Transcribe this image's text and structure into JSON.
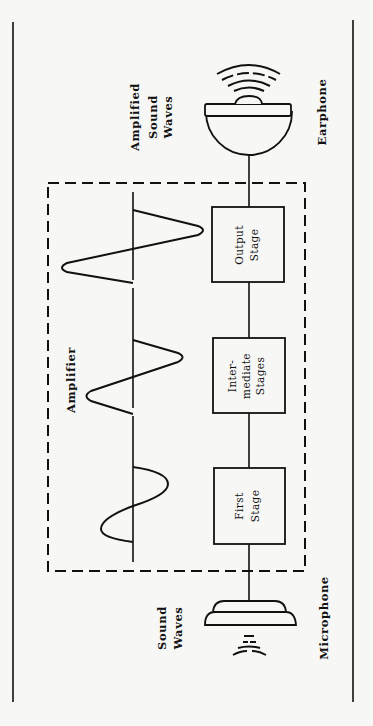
{
  "diagram": {
    "labels": {
      "amplified_sound_waves": [
        "Amplified",
        "Sound",
        "Waves"
      ],
      "earphone": "Earphone",
      "amplifier": "Amplifier",
      "sound_waves": [
        "Sound",
        "Waves"
      ],
      "microphone": "Microphone"
    },
    "stages": [
      {
        "id": "output",
        "lines": [
          "Output",
          "Stage"
        ]
      },
      {
        "id": "intermediate",
        "lines": [
          "Inter-",
          "mediate",
          "Stages"
        ]
      },
      {
        "id": "first",
        "lines": [
          "First",
          "Stage"
        ]
      }
    ],
    "signal_waves": [
      {
        "stage": "output",
        "amplitude": "large"
      },
      {
        "stage": "intermediate",
        "amplitude": "medium"
      },
      {
        "stage": "first",
        "amplitude": "small"
      }
    ],
    "colors": {
      "ink": "#111111",
      "paper": "#f7f7f5"
    }
  }
}
